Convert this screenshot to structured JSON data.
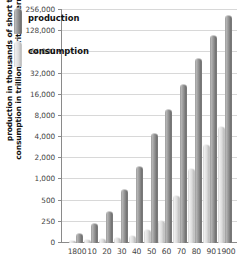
{
  "chart_data": {
    "type": "bar",
    "title": "",
    "xlabel": "",
    "ylabel_line1": "production in thousands of short tons,",
    "ylabel_line2": "consumption in trillions of British thermal units",
    "categories": [
      "1800",
      "10",
      "20",
      "30",
      "40",
      "50",
      "60",
      "70",
      "80",
      "90",
      "1900"
    ],
    "series": [
      {
        "name": "production",
        "values": [
          110,
          220,
          350,
          700,
          1500,
          4400,
          9600,
          22000,
          52000,
          111000,
          212000
        ]
      },
      {
        "name": "consumption",
        "values": [
          28,
          35,
          45,
          60,
          80,
          150,
          260,
          580,
          1400,
          3100,
          5600
        ]
      }
    ],
    "yticks": [
      0,
      250,
      500,
      1000,
      2000,
      4000,
      8000,
      16000,
      32000,
      64000,
      128000,
      256000
    ],
    "ytick_labels": [
      "0",
      "250",
      "500",
      "1,000",
      "2,000",
      "4,000",
      "8,000",
      "16,000",
      "32,000",
      "64,000",
      "128,000",
      "256,000"
    ],
    "yscale": "log2",
    "ylim": [
      0,
      256000
    ],
    "grid": true,
    "legend": {
      "position": "top-left",
      "entries": [
        {
          "label": "production",
          "color": "#8f8f8f"
        },
        {
          "label": "consumption",
          "color": "#dcdcdc"
        }
      ]
    },
    "colors": {
      "production": "#8f8f8f",
      "consumption": "#dcdcdc",
      "gridline": "#d8d8d8",
      "axis": "#8a8a8a",
      "text": "#444444",
      "background": "#ffffff"
    }
  }
}
